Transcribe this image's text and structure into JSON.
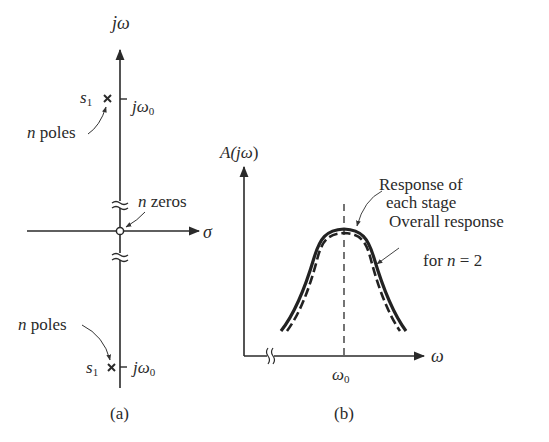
{
  "figure_a": {
    "caption": "(a)",
    "vertical_axis_label": "jω",
    "horizontal_axis_label": "σ",
    "upper_pole": {
      "symbol": "s",
      "subscript": "1",
      "marker": "×",
      "tick_label": "jω",
      "tick_subscript": "0"
    },
    "lower_pole": {
      "symbol": "s",
      "subscript": "1",
      "marker": "×",
      "tick_label": "jω",
      "tick_subscript": "0"
    },
    "upper_pole_note": {
      "n": "n",
      "text": " poles"
    },
    "lower_pole_note": {
      "n": "n",
      "text": " poles"
    },
    "zeros_note": {
      "n": "n",
      "text": " zeros"
    },
    "zero_marker": "○"
  },
  "figure_b": {
    "caption": "(b)",
    "y_axis_label_A": "A(",
    "y_axis_label_j": "jω",
    "y_axis_label_close": ")",
    "x_axis_label": "ω",
    "center_tick_label": "ω",
    "center_tick_subscript": "0",
    "annotation_each_stage_line1": "Response of",
    "annotation_each_stage_line2": "each stage",
    "annotation_overall_line1": "Overall response",
    "annotation_overall_line2_pre": "for ",
    "annotation_overall_line2_n": "n",
    "annotation_overall_line2_post": " = 2",
    "curves": [
      {
        "name": "Response of each stage",
        "style": "solid, thick"
      },
      {
        "name": "Overall response for n = 2",
        "style": "dashed, narrower"
      }
    ]
  }
}
